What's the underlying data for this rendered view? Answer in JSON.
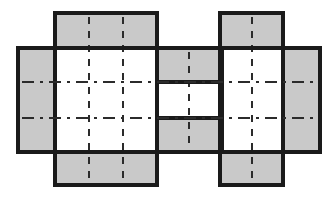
{
  "figure": {
    "type": "carton-dieline-net",
    "canvas": {
      "width": 336,
      "height": 198
    },
    "colors": {
      "panel_fill_gray": "#c9c9c9",
      "panel_fill_white": "#ffffff",
      "cut_line": "#1a1a1a",
      "fold_line": "#2b2b2b",
      "background": "#ffffff"
    },
    "stroke_widths": {
      "cut": 4.2,
      "fold_dashed": 1.9,
      "fold_dashdot": 1.9
    }
  },
  "panels": {
    "left_side_flap": {
      "name": "left-side-flap",
      "x": 18,
      "y": 48,
      "w": 37,
      "h": 104,
      "fill": "gray"
    },
    "right_side_flap": {
      "name": "right-side-flap",
      "x": 283,
      "y": 48,
      "w": 37,
      "h": 104,
      "fill": "gray"
    },
    "top_left_flap": {
      "name": "top-left-flap",
      "x": 55,
      "y": 13,
      "w": 102,
      "h": 35,
      "fill": "gray"
    },
    "top_right_flap": {
      "name": "top-right-flap",
      "x": 220,
      "y": 13,
      "w": 63,
      "h": 35,
      "fill": "gray"
    },
    "bottom_left_flap": {
      "name": "bottom-left-flap",
      "x": 55,
      "y": 152,
      "w": 102,
      "h": 33,
      "fill": "gray"
    },
    "bottom_right_flap": {
      "name": "bottom-right-flap",
      "x": 220,
      "y": 152,
      "w": 63,
      "h": 33,
      "fill": "gray"
    },
    "middle_upper_flap": {
      "name": "middle-upper-flap",
      "x": 157,
      "y": 48,
      "w": 65,
      "h": 34,
      "fill": "gray"
    },
    "middle_lower_flap": {
      "name": "middle-lower-flap",
      "x": 157,
      "y": 118,
      "w": 65,
      "h": 34,
      "fill": "gray"
    },
    "body_left_panel": {
      "name": "body-left-panel",
      "x": 55,
      "y": 48,
      "w": 102,
      "h": 104,
      "fill": "white"
    },
    "body_center_gap": {
      "name": "body-center-panel",
      "x": 157,
      "y": 82,
      "w": 65,
      "h": 36,
      "fill": "white"
    },
    "body_right_panel": {
      "name": "body-right-panel",
      "x": 222,
      "y": 48,
      "w": 61,
      "h": 104,
      "fill": "white"
    }
  },
  "fold_lines": {
    "horizontal_dashdot": [
      {
        "name": "upper-horizontal-fold",
        "y": 82,
        "x1": 22,
        "x2": 316
      },
      {
        "name": "lower-horizontal-fold",
        "y": 118,
        "x1": 22,
        "x2": 316
      }
    ],
    "vertical_dashed": [
      {
        "name": "fold-v-left-a",
        "x": 89,
        "y1": 17,
        "y2": 181
      },
      {
        "name": "fold-v-left-b",
        "x": 123,
        "y1": 17,
        "y2": 181
      },
      {
        "name": "fold-v-middle",
        "x": 189,
        "y1": 52,
        "y2": 148
      },
      {
        "name": "fold-v-right",
        "x": 252,
        "y1": 17,
        "y2": 181
      }
    ],
    "short_vertical_ticks": [
      {
        "name": "tick-center-upper",
        "x": 157,
        "y1": 86,
        "y2": 114
      },
      {
        "name": "tick-center-lower",
        "x": 222,
        "y1": 86,
        "y2": 114
      }
    ]
  },
  "cut_outline": {
    "name": "outer-cut-contour",
    "description": "Heavy black die-cut perimeter following all flap edges",
    "points": "55,13 157,13 157,48 220,48 220,13 283,13 283,48 320,48 320,152 283,152 283,185 220,185 220,152 157,152 157,185 55,185 55,152 18,152 18,48 55,48"
  }
}
